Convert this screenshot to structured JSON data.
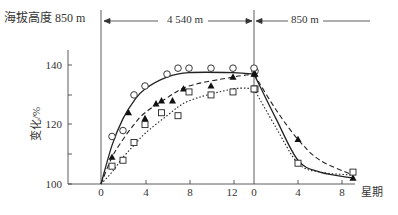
{
  "chart_data": {
    "type": "line",
    "title": "",
    "header": {
      "altitude_label": "海拔高度 850 m",
      "segment_high": "4 540 m",
      "segment_low": "850 m"
    },
    "xlabel": "星期",
    "ylabel": "变化/%",
    "ylim": [
      100,
      145
    ],
    "yticks": [
      100,
      110,
      120,
      130,
      140
    ],
    "ytick_labels": [
      "100",
      "",
      "120",
      "",
      "140"
    ],
    "xticks_high_altitude": [
      0,
      4,
      8,
      12
    ],
    "xticks_return": [
      0,
      4,
      8
    ],
    "xtick_labels": [
      "0",
      "4",
      "8",
      "12",
      "0",
      "4",
      "8"
    ],
    "grid": false,
    "series": [
      {
        "name": "circles (solid line)",
        "marker": "open-circle",
        "line": "solid",
        "high_altitude": {
          "x": [
            1,
            2,
            3,
            4,
            6,
            7,
            8,
            10,
            12,
            14
          ],
          "y": [
            116,
            118,
            130,
            133,
            137,
            139,
            139,
            139,
            139,
            138
          ]
        },
        "return": {
          "x": [
            0
          ],
          "y": [
            139
          ]
        }
      },
      {
        "name": "filled triangles (dashed line)",
        "marker": "filled-triangle",
        "line": "dashed",
        "high_altitude": {
          "x": [
            1,
            2.5,
            4,
            5,
            5.5,
            6.5,
            7.5,
            10,
            12,
            14
          ],
          "y": [
            109,
            124,
            122,
            127,
            128,
            128,
            132,
            133,
            136,
            137
          ]
        },
        "return": {
          "x": [
            0,
            4,
            9
          ],
          "y": [
            137,
            115,
            102
          ]
        }
      },
      {
        "name": "open squares (dotted line)",
        "marker": "open-square",
        "line": "dotted",
        "high_altitude": {
          "x": [
            1,
            2,
            3,
            4,
            5.5,
            7,
            8,
            10,
            12,
            14
          ],
          "y": [
            106,
            108,
            114,
            120,
            124,
            123,
            131,
            130,
            131,
            132
          ]
        },
        "return": {
          "x": [
            0,
            4,
            9
          ],
          "y": [
            132,
            107,
            104
          ]
        }
      }
    ],
    "curves": {
      "solid": {
        "high": [
          [
            0,
            100
          ],
          [
            1,
            113
          ],
          [
            2,
            122
          ],
          [
            3,
            128
          ],
          [
            4,
            132
          ],
          [
            6,
            136
          ],
          [
            8,
            137.5
          ],
          [
            12,
            137.5
          ],
          [
            14,
            137
          ]
        ],
        "return": [
          [
            0,
            137
          ],
          [
            2,
            122
          ],
          [
            4,
            108
          ],
          [
            6,
            104
          ],
          [
            9,
            102
          ]
        ]
      },
      "dashed": {
        "high": [
          [
            0,
            100
          ],
          [
            1,
            109
          ],
          [
            2,
            115
          ],
          [
            3,
            120
          ],
          [
            4,
            124
          ],
          [
            6,
            129
          ],
          [
            8,
            133
          ],
          [
            12,
            136
          ],
          [
            14,
            137
          ]
        ],
        "return": [
          [
            0,
            137
          ],
          [
            2,
            125
          ],
          [
            4,
            115
          ],
          [
            6,
            108
          ],
          [
            9,
            103
          ]
        ]
      },
      "dotted": {
        "high": [
          [
            0,
            100
          ],
          [
            1,
            104
          ],
          [
            2,
            109
          ],
          [
            3,
            113
          ],
          [
            4,
            117
          ],
          [
            6,
            123
          ],
          [
            8,
            128
          ],
          [
            12,
            132
          ],
          [
            14,
            132
          ]
        ],
        "return": [
          [
            0,
            132
          ],
          [
            2,
            119
          ],
          [
            4,
            107
          ],
          [
            6,
            104
          ],
          [
            9,
            103
          ]
        ]
      }
    }
  }
}
